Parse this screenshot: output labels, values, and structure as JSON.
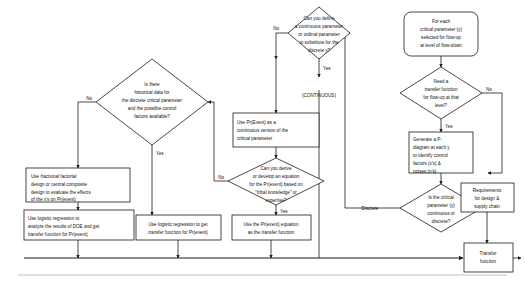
{
  "diagram": {
    "colors": {
      "stroke": "#1a1a1a",
      "fill": "#ffffff",
      "divider": "#b9b9b9",
      "text": "#111111"
    },
    "nodes": {
      "start": {
        "shape": "rounded-rect",
        "lines": [
          "For each",
          "critical parameter (y)",
          "selected for flow-up",
          "at level of flow-down"
        ]
      },
      "need_transfer_function": {
        "shape": "diamond",
        "lines": [
          "Need a",
          "transfer function",
          "for flow-up at that",
          "level?"
        ]
      },
      "generate_p_diagram": {
        "shape": "rect",
        "lines": [
          "Generate a P-",
          "diagram at each y",
          "to identify control",
          "factors (x's) &",
          "noises (n's)"
        ]
      },
      "is_critical_parameter": {
        "shape": "diamond",
        "lines": [
          "Is the critical",
          "parameter (y)",
          "continuous or",
          "discrete?"
        ]
      },
      "requirements": {
        "shape": "rect",
        "lines": [
          "Requirements",
          "for design &",
          "supply chain"
        ]
      },
      "transfer_function": {
        "shape": "rect",
        "lines": [
          "Transfer",
          "function"
        ]
      },
      "can_you_define": {
        "shape": "diamond",
        "lines": [
          "Can you define",
          "a continuous parameter",
          "or ordinal parameter",
          "to substitute for the",
          "discrete y?"
        ]
      },
      "use_pr_event_continuous": {
        "shape": "rect",
        "lines": [
          "Use Pr(Event) as a",
          "continuous version of the",
          "critical parameter"
        ]
      },
      "can_you_derive": {
        "shape": "diamond",
        "lines": [
          "Can you derive",
          "or develop an equation",
          "for the Pr(event) based on",
          "\"tribal knowledge\" or",
          "expertise?"
        ]
      },
      "use_pr_event_equation": {
        "shape": "rect",
        "lines": [
          "Use the Pr(event) equation",
          "as the transfer function"
        ]
      },
      "is_there_historical_data": {
        "shape": "diamond",
        "lines": [
          "Is there",
          "historical data for",
          "the discrete critical parameter",
          "and the possible control",
          "factors available?"
        ]
      },
      "use_fractional_factorial": {
        "shape": "rect",
        "lines": [
          "Use fractional factorial",
          "design or central composite",
          "design to evaluate the effects",
          "of the x's on Pr(event)"
        ]
      },
      "use_logistic_doe": {
        "shape": "rect",
        "lines": [
          "Use logistic regression to",
          "analyze the results of DOE and get",
          "transfer function for Pr(event)"
        ]
      },
      "use_logistic_get_tf": {
        "shape": "rect",
        "lines": [
          "Use logistic regression to get",
          "transfer function for Pr(event)"
        ]
      }
    },
    "edge_labels": {
      "define_no": "No",
      "define_yes": "Yes",
      "continuous_tag": "(CONTINUOUS)",
      "need_tf_no": "No",
      "need_tf_yes": "Yes",
      "critical_discrete": "Discrete",
      "derive_no": "No",
      "derive_yes": "Yes",
      "historical_no": "No",
      "historical_yes": "Yes"
    }
  }
}
